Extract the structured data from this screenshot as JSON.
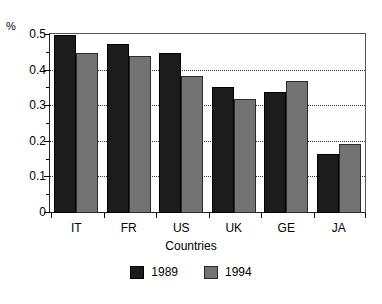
{
  "chart_data": {
    "type": "bar",
    "title": "",
    "xlabel": "Countries",
    "ylabel": "%",
    "categories": [
      "IT",
      "FR",
      "US",
      "UK",
      "GE",
      "JA"
    ],
    "series": [
      {
        "name": "1989",
        "color": "#1c1c1c",
        "values": [
          0.5,
          0.475,
          0.45,
          0.355,
          0.34,
          0.165
        ]
      },
      {
        "name": "1994",
        "color": "#737373",
        "values": [
          0.45,
          0.44,
          0.385,
          0.32,
          0.37,
          0.195
        ]
      }
    ],
    "ylim": [
      0,
      0.5
    ],
    "ytick_labels": [
      "0",
      "0.1",
      "0.2",
      "0.3",
      "0.4",
      "0.5"
    ],
    "ytick_values": [
      0,
      0.1,
      0.2,
      0.3,
      0.4,
      0.5
    ],
    "yminor_values": [
      0.05,
      0.15,
      0.25,
      0.35,
      0.45
    ],
    "grid": "horizontal-dotted",
    "legend_position": "bottom-center"
  },
  "axis": {
    "unit_label": "%",
    "x_title": "Countries"
  },
  "legend": {
    "items": [
      {
        "label": "1989"
      },
      {
        "label": "1994"
      }
    ]
  }
}
